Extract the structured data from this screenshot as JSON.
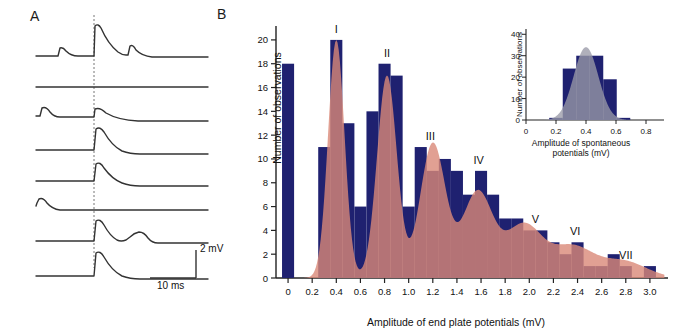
{
  "panels": {
    "a": {
      "letter": "A",
      "scale_vertical": "2 mV",
      "scale_horizontal": "10 ms",
      "trace_count": 8
    },
    "b": {
      "letter": "B"
    }
  },
  "chart_data": [
    {
      "id": "main-histogram",
      "type": "bar",
      "title": "",
      "xlabel": "Amplitude of end plate potentials (mV)",
      "ylabel": "Number of observations",
      "xlim": [
        -0.1,
        3.15
      ],
      "ylim": [
        0,
        21
      ],
      "xticks": [
        0,
        0.2,
        0.4,
        0.6,
        0.8,
        1.0,
        1.2,
        1.4,
        1.6,
        1.8,
        2.0,
        2.2,
        2.4,
        2.6,
        2.8,
        3.0
      ],
      "xtick_labels": [
        "0",
        "0.2",
        "0.4",
        "0.6",
        "0.8",
        "1.0",
        "1.2",
        "1.4",
        "1.6",
        "1.8",
        "2.0",
        "2.2",
        "2.4",
        "2.6",
        "2.8",
        "3.0"
      ],
      "yticks": [
        0,
        2,
        4,
        6,
        8,
        10,
        12,
        14,
        16,
        18,
        20
      ],
      "ytick_labels": [
        "0",
        "2",
        "4",
        "6",
        "8",
        "10",
        "12",
        "14",
        "16",
        "18",
        "20"
      ],
      "grid": false,
      "legend": false,
      "bar_color": "#1f2170",
      "curve_color": "#d98878",
      "bin_width": 0.1,
      "failures_bar": {
        "x": 0.0,
        "value": 18,
        "label": "failures"
      },
      "bins_left": [
        0.25,
        0.35,
        0.45,
        0.55,
        0.65,
        0.75,
        0.85,
        0.95,
        1.05,
        1.15,
        1.25,
        1.35,
        1.45,
        1.55,
        1.65,
        1.75,
        1.85,
        1.95,
        2.05,
        2.15,
        2.25,
        2.35,
        2.45,
        2.55,
        2.65,
        2.75,
        2.85,
        2.95
      ],
      "values": [
        11,
        20,
        13,
        6,
        14,
        18,
        17,
        6,
        11,
        9,
        10,
        9,
        7,
        9,
        7,
        5,
        5,
        4,
        4,
        3,
        2,
        3,
        1,
        1,
        2,
        1,
        0,
        1
      ],
      "annotations": [
        {
          "label": "I",
          "x": 0.4,
          "peak": 20
        },
        {
          "label": "II",
          "x": 0.82,
          "peak": 18
        },
        {
          "label": "III",
          "x": 1.18,
          "peak": 11
        },
        {
          "label": "IV",
          "x": 1.58,
          "peak": 9
        },
        {
          "label": "V",
          "x": 2.05,
          "peak": 4
        },
        {
          "label": "VI",
          "x": 2.38,
          "peak": 3
        },
        {
          "label": "VII",
          "x": 2.8,
          "peak": 1
        }
      ],
      "fit_curve_note": "multi-Gaussian theoretical fit overlay"
    },
    {
      "id": "inset-histogram",
      "type": "bar",
      "title": "",
      "xlabel": "Amplitude of spontaneous potentials (mV)",
      "ylabel": "Number of observations",
      "xlim": [
        0,
        0.92
      ],
      "ylim": [
        0,
        42
      ],
      "xticks": [
        0,
        0.2,
        0.4,
        0.6,
        0.8
      ],
      "xtick_labels": [
        "0",
        "0.2",
        "0.4",
        "0.6",
        "0.8"
      ],
      "yticks": [
        0,
        10,
        20,
        30,
        40
      ],
      "ytick_labels": [
        "0",
        "10",
        "20",
        "30",
        "40"
      ],
      "grid": false,
      "legend": false,
      "bar_color": "#1f2170",
      "curve_color": "#9a9aa8",
      "bin_width": 0.09,
      "bins_left": [
        0.155,
        0.245,
        0.335,
        0.425,
        0.515,
        0.605
      ],
      "values": [
        1,
        24,
        30,
        30,
        19,
        1
      ],
      "fit_curve_note": "single Gaussian fit overlay, peak ~34 at 0.40"
    }
  ]
}
